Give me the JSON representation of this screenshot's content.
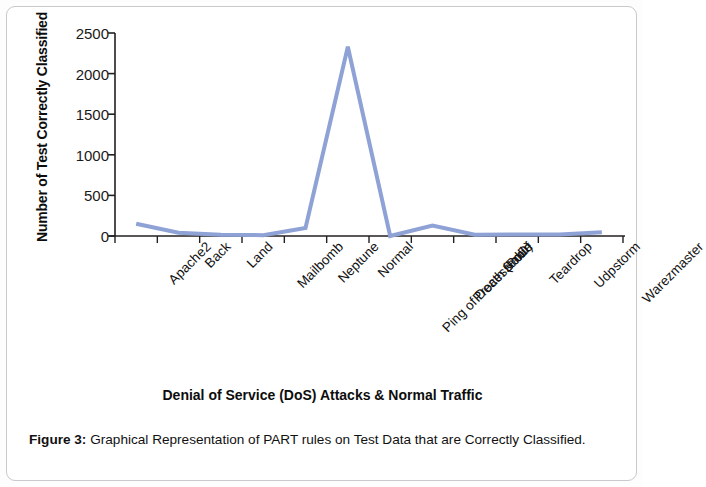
{
  "figure": {
    "caption_label": "Figure 3:",
    "caption_text": " Graphical Representation of PART rules on Test Data that are Correctly Classified."
  },
  "chart_data": {
    "type": "line",
    "title": "",
    "xlabel": "Denial of Service (DoS) Attacks & Normal Traffic",
    "ylabel": "Number of Test Correctly Classified",
    "categories": [
      "Apache2",
      "Back",
      "Land",
      "Mailbomb",
      "Neptune",
      "Normal",
      "Ping of Death (PoD)",
      "Processtable",
      "Smurf",
      "Teardrop",
      "Udpstorm",
      "Warezmaster"
    ],
    "values": [
      150,
      40,
      15,
      10,
      100,
      2330,
      0,
      130,
      15,
      20,
      20,
      45
    ],
    "ylim": [
      0,
      2500
    ],
    "yticks": [
      0,
      500,
      1000,
      1500,
      2000,
      2500
    ],
    "ytick_labels": [
      "0",
      "500",
      "1000",
      "1500",
      "2000",
      "2500"
    ],
    "grid": false,
    "legend": false,
    "series_color": "#8EA2D6",
    "axis_color": "#231f20",
    "line_width": 4
  }
}
